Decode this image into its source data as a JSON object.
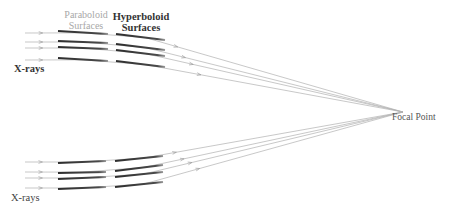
{
  "labels": {
    "paraboloid": {
      "line1": "Paraboloid",
      "line2": "Surfaces"
    },
    "hyperboloid": {
      "line1": "Hyperboloid",
      "line2": "Surfaces"
    },
    "xrays_top": "X-rays",
    "xrays_bottom": "X-rays",
    "focal_point": "Focal Point"
  },
  "colors": {
    "mirror": "#3a3a3a",
    "ray": "#b0b0b0",
    "paraboloid_label": "#a8a8a8",
    "dark_label": "#333333"
  },
  "focal_point": {
    "x": 403,
    "y": 112
  },
  "groups": [
    {
      "name": "top",
      "rays": [
        {
          "y_in": 33,
          "para": [
            58,
            31,
            108,
            34
          ],
          "hyper": [
            116,
            34,
            165,
            40
          ]
        },
        {
          "y_in": 42,
          "para": [
            58,
            41,
            108,
            43
          ],
          "hyper": [
            116,
            44,
            165,
            50
          ]
        },
        {
          "y_in": 48,
          "para": [
            58,
            47,
            108,
            49
          ],
          "hyper": [
            116,
            50,
            165,
            56
          ]
        },
        {
          "y_in": 60,
          "para": [
            58,
            58,
            108,
            61
          ],
          "hyper": [
            116,
            61,
            165,
            67
          ]
        }
      ]
    },
    {
      "name": "bottom",
      "rays": [
        {
          "y_in": 162,
          "para": [
            58,
            163,
            106,
            161
          ],
          "hyper": [
            115,
            161,
            163,
            156
          ]
        },
        {
          "y_in": 172,
          "para": [
            58,
            173,
            106,
            172
          ],
          "hyper": [
            115,
            171,
            163,
            165
          ]
        },
        {
          "y_in": 178,
          "para": [
            58,
            179,
            106,
            177
          ],
          "hyper": [
            115,
            177,
            163,
            172
          ]
        },
        {
          "y_in": 188,
          "para": [
            58,
            189,
            106,
            187
          ],
          "hyper": [
            115,
            187,
            163,
            182
          ]
        }
      ]
    }
  ]
}
